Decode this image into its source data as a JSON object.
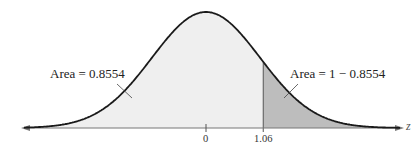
{
  "diagram": {
    "type": "standard-normal-curve",
    "axis_label": "z",
    "mean_tick": "0",
    "z_tick": "1.06",
    "z_value": 1.06,
    "left_area_label": "Area = 0.8554",
    "right_area_label": "Area = 1 − 0.8554",
    "colors": {
      "curve": "#1a1a1a",
      "left_fill": "#efefef",
      "right_fill": "#bdbdbd",
      "axis": "#777777"
    }
  }
}
